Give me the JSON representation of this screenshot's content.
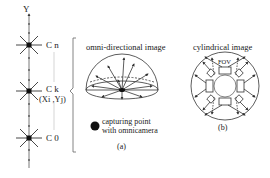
{
  "diagram": {
    "axis": {
      "label": "Y"
    },
    "nodes": [
      {
        "id": "Cn",
        "label": "C n",
        "y": 45
      },
      {
        "id": "Ck",
        "label": "C k",
        "coords": "(Xi ,Yj)",
        "y": 91
      },
      {
        "id": "C0",
        "label": "C 0",
        "y": 138
      }
    ],
    "panel_a": {
      "title": "omni-directional image",
      "legend": "capturing point with omnicamera",
      "legend_line1": "capturing  point",
      "legend_line2": "with omnicamera",
      "caption": "(a)"
    },
    "panel_b": {
      "title": "cylindrical image",
      "fov_label": "FOV",
      "caption": "(b)"
    },
    "colors": {
      "line": "#333333",
      "light_line": "#bbbbbb",
      "dot": "#111111"
    }
  }
}
